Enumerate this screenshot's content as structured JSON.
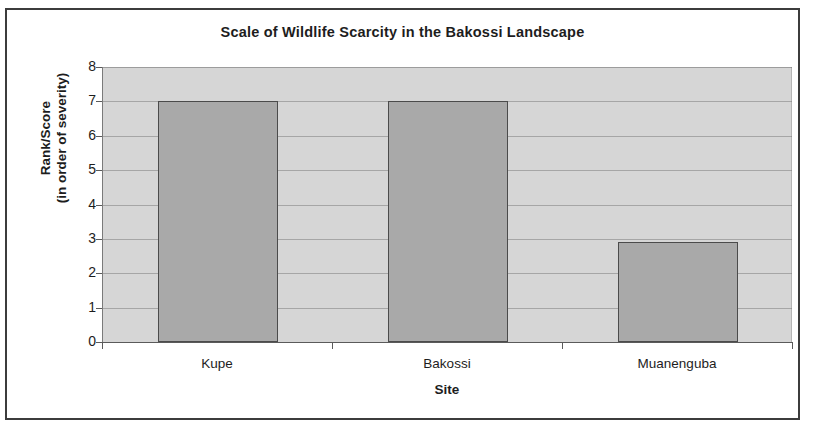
{
  "chart_data": {
    "type": "bar",
    "title": "Scale of Wildlife Scarcity in the Bakossi Landscape",
    "xlabel": "Site",
    "ylabel": "Rank/Score (in order of severity)",
    "ylabel_line1": "Rank/Score",
    "ylabel_line2": "(in order of severity)",
    "categories": [
      "Kupe",
      "Bakossi",
      "Muanenguba"
    ],
    "values": [
      7,
      7,
      2.9
    ],
    "ylim": [
      0,
      8
    ],
    "ytick_labels": [
      "0",
      "1",
      "2",
      "3",
      "4",
      "5",
      "6",
      "7",
      "8"
    ],
    "yticks": [
      0,
      1,
      2,
      3,
      4,
      5,
      6,
      7,
      8
    ],
    "grid": true,
    "legend": false,
    "colors": {
      "bar_fill": "#a9a9a9",
      "bar_border": "#4b4b4b",
      "plot_background": "#d6d6d6",
      "gridline": "#9a9a9a",
      "axis": "#5a5a5a",
      "text": "#1d1d1d",
      "frame_border": "#3c3c3c",
      "page_background": "#ffffff"
    }
  }
}
